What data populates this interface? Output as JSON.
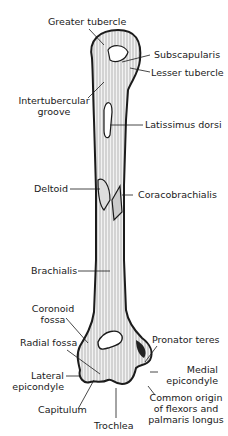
{
  "figure": {
    "colors": {
      "ink": "#1a1a1a",
      "background": "#ffffff",
      "bone_fill": "#f2f2f2"
    }
  },
  "labels": {
    "greater_tubercle": "Greater tubercle",
    "subscapularis": "Subscapularis",
    "lesser_tubercle": "Lesser tubercle",
    "intertubercular_1": "Intertubercular",
    "intertubercular_2": "groove",
    "latissimus_dorsi": "Latissimus dorsi",
    "deltoid": "Deltoid",
    "coracobrachialis": "Coracobrachialis",
    "brachialis": "Brachialis",
    "coronoid_1": "Coronoid",
    "coronoid_2": "fossa",
    "radial_fossa": "Radial fossa",
    "pronator_teres": "Pronator teres",
    "lateral_1": "Lateral",
    "lateral_2": "epicondyle",
    "medial_1": "Medial",
    "medial_2": "epicondyle",
    "capitulum": "Capitulum",
    "trochlea": "Trochlea",
    "common_1": "Common origin",
    "common_2": "of flexors and",
    "common_3": "palmaris longus"
  }
}
